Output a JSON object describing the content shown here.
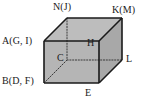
{
  "figure": {
    "type": "cube-diagram",
    "background_color": "#ffffff",
    "stroke_color": "#1a1a1a",
    "face_colors": {
      "top": "#bdbdbd",
      "front": "#b5b5b5",
      "right": "#a8a8a8"
    },
    "hidden_line_style": "dotted",
    "vertices": [
      {
        "id": "A",
        "label": "A(G, I)",
        "role": "front-top-left",
        "aliases": [
          "G",
          "I"
        ],
        "hidden": false,
        "x": 44,
        "y": 41
      },
      {
        "id": "N",
        "label": "N(J)",
        "role": "back-top-left",
        "aliases": [
          "J"
        ],
        "hidden": false,
        "x": 67,
        "y": 18
      },
      {
        "id": "K",
        "label": "K(M)",
        "role": "back-top-right",
        "aliases": [
          "M"
        ],
        "hidden": false,
        "x": 122,
        "y": 18
      },
      {
        "id": "H",
        "label": "H",
        "role": "front-top-right",
        "aliases": [],
        "hidden": false,
        "x": 99,
        "y": 41
      },
      {
        "id": "C",
        "label": "C",
        "role": "back-bottom-left",
        "aliases": [],
        "hidden": true,
        "x": 67,
        "y": 60
      },
      {
        "id": "L",
        "label": "L",
        "role": "back-bottom-right",
        "aliases": [],
        "hidden": false,
        "x": 122,
        "y": 60
      },
      {
        "id": "B",
        "label": "B(D, F)",
        "role": "front-bottom-left",
        "aliases": [
          "D",
          "F"
        ],
        "hidden": false,
        "x": 44,
        "y": 83
      },
      {
        "id": "E",
        "label": "E",
        "role": "front-bottom-right",
        "aliases": [],
        "hidden": false,
        "x": 99,
        "y": 83
      }
    ],
    "edges": [
      {
        "from": "A",
        "to": "H",
        "hidden": false
      },
      {
        "from": "H",
        "to": "E",
        "hidden": false
      },
      {
        "from": "E",
        "to": "B",
        "hidden": false
      },
      {
        "from": "B",
        "to": "A",
        "hidden": false
      },
      {
        "from": "A",
        "to": "N",
        "hidden": false
      },
      {
        "from": "H",
        "to": "K",
        "hidden": false
      },
      {
        "from": "N",
        "to": "K",
        "hidden": false
      },
      {
        "from": "K",
        "to": "L",
        "hidden": false
      },
      {
        "from": "E",
        "to": "L",
        "hidden": false
      },
      {
        "from": "N",
        "to": "C",
        "hidden": true
      },
      {
        "from": "C",
        "to": "B",
        "hidden": true
      },
      {
        "from": "C",
        "to": "L",
        "hidden": true
      }
    ]
  }
}
